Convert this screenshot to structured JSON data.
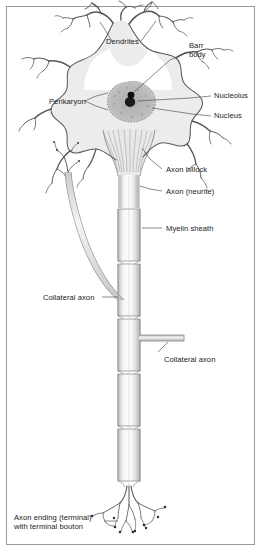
{
  "figure": {
    "border_color": "#9a9a9a",
    "background": "#ffffff",
    "ink_color": "#4a4a4a",
    "soma_fill": "#ececec",
    "nucleus_fill": "#b5b5b5",
    "barr_body_fill": "#111111"
  },
  "labels": {
    "dendrites": "Dendrites",
    "barr_body_line1": "Barr",
    "barr_body_line2": "body",
    "perikaryon": "Perikaryon",
    "nucleolus": "Nucleolus",
    "nucleus": "Nucleus",
    "axon_hillock": "Axon hillock",
    "axon_neurite": "Axon (neurite)",
    "myelin_sheath": "Myelin sheath",
    "collateral_axon_left": "Collateral axon",
    "collateral_axon_right": "Collateral axon",
    "axon_ending_line1": "Axon ending (terminal)",
    "axon_ending_line2": "with terminal bouton"
  },
  "parts": [
    {
      "id": "dendrites",
      "name": "Dendrites"
    },
    {
      "id": "perikaryon",
      "name": "Perikaryon"
    },
    {
      "id": "nucleus",
      "name": "Nucleus"
    },
    {
      "id": "nucleolus",
      "name": "Nucleolus"
    },
    {
      "id": "barr-body",
      "name": "Barr body"
    },
    {
      "id": "axon-hillock",
      "name": "Axon hillock"
    },
    {
      "id": "axon",
      "name": "Axon (neurite)"
    },
    {
      "id": "myelin-sheath",
      "name": "Myelin sheath"
    },
    {
      "id": "collateral-axon",
      "name": "Collateral axon"
    },
    {
      "id": "axon-terminal",
      "name": "Axon ending (terminal) with terminal bouton"
    }
  ]
}
